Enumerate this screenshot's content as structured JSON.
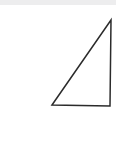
{
  "canvas": {
    "width": 116,
    "height": 146,
    "background_color": "#ffffff"
  },
  "top_band": {
    "color": "#ededee",
    "height": 5
  },
  "figure": {
    "name": "right-triangle",
    "shape_type": "triangle",
    "fill": "none",
    "stroke_color": "#2b2b2b",
    "stroke_width": 1.5,
    "right_angle_corner": "bottom-right",
    "vertices": [
      {
        "label": "bottom-left",
        "x": 52,
        "y": 105
      },
      {
        "label": "bottom-right",
        "x": 110,
        "y": 106
      },
      {
        "label": "top-right",
        "x": 111,
        "y": 20
      }
    ],
    "edges": [
      {
        "label": "hypotenuse",
        "from": "bottom-left",
        "to": "top-right"
      },
      {
        "label": "vertical-leg",
        "from": "top-right",
        "to": "bottom-right"
      },
      {
        "label": "horizontal-leg",
        "from": "bottom-right",
        "to": "bottom-left"
      }
    ],
    "points_attr": "52,105 111,20 110,106"
  }
}
